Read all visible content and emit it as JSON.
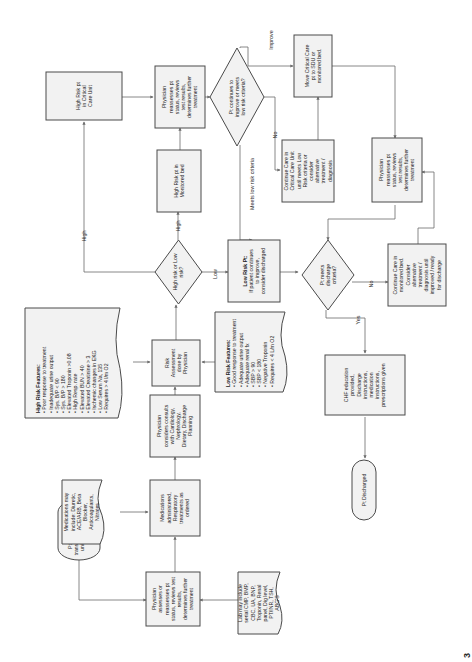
{
  "diagram": {
    "orientation": "rotated-90-counterclockwise",
    "nodes": {
      "start": {
        "type": "terminator",
        "lines": [
          "Pt with acute HF",
          "transported to nursing",
          "unit from ED or as",
          "Direct Admit"
        ]
      },
      "assess": {
        "type": "process",
        "lines": [
          "Physician",
          "assesses or",
          "reassesses pt",
          "status, reviews test",
          "results,",
          "determines further",
          "treatment"
        ]
      },
      "labs": {
        "type": "document",
        "lines": [
          "Lab may include",
          "serial CMP, BMP,",
          "CBC, UA, BNP,",
          "Troponin, Renal",
          "panel, Dig level,",
          "PT/INR, TSH,",
          "ABG'S"
        ]
      },
      "meds_admin": {
        "type": "process",
        "lines": [
          "Medications",
          "administered,",
          "Respiratory",
          "treatments as",
          "ordered"
        ]
      },
      "meds_note": {
        "type": "document",
        "lines": [
          "Medications may",
          "include: Diuretic,",
          "ACE/ARB, Beta",
          "Blocker,",
          "Anticoagulants,",
          "Nitrates"
        ]
      },
      "consults": {
        "type": "process",
        "lines": [
          "Physician",
          "considers consults",
          "with Cardiology,",
          "Nephrology,",
          "Dietary, Discharge",
          "Planning"
        ]
      },
      "risk_assess": {
        "type": "process",
        "lines": [
          "Risk",
          "Assessment",
          "done by",
          "Physician"
        ]
      },
      "high_features": {
        "type": "document",
        "title": "High Risk Features:",
        "items": [
          "Poor response to treatment",
          "Inadequate urine output",
          "Sys. B/P < 90",
          "Sys. B/P > 180",
          "Elevated Troponin >0.08",
          "High Resp. rate",
          "Elevated BUN > 40",
          "Elevated Creatinine > 3",
          "Ischemic changes in EKG",
          "Low Serum Na, 135",
          "Requires > 4 l/m O2"
        ]
      },
      "low_features": {
        "type": "document",
        "title": "Low Risk Features:",
        "items": [
          "Good response to treatment",
          "Adequate urine output",
          "Adequate renal fx",
          "SBP > 90",
          "SBP < 180",
          "Negative Troponin",
          "Requires < 4 L/m O2"
        ]
      },
      "risk_decision": {
        "type": "decision",
        "lines": [
          "High risk or Low",
          "risk?"
        ]
      },
      "low_risk_pt": {
        "type": "process",
        "title": "Low Risk Pt:",
        "lines": [
          "If patient continues",
          "to improve,",
          "consider discharged"
        ]
      },
      "high_monitored": {
        "type": "process",
        "lines": [
          "High Risk pt in",
          "Monitored bed"
        ]
      },
      "high_ccu": {
        "type": "process",
        "lines": [
          "High Risk pt",
          "in Critical",
          "Care Unit"
        ]
      },
      "reassess_top": {
        "type": "process",
        "lines": [
          "Physician",
          "reassesses pt",
          "status, reviews",
          "test results,",
          "determines further",
          "treatment"
        ]
      },
      "improve_decision": {
        "type": "decision",
        "lines": [
          "Pt continues to",
          "improve or meets",
          "low risk criteria?"
        ]
      },
      "move_ccu": {
        "type": "process",
        "lines": [
          "Move Critical Care",
          "pt to SDU or",
          "monitored bed."
        ]
      },
      "continue_ccu": {
        "type": "process",
        "lines": [
          "Continue Care in",
          "Critical Care Unit",
          "until meets Low",
          "Risk criteria or",
          "consider",
          "alternative",
          "treatment /",
          "diagnosis"
        ]
      },
      "reassess_right": {
        "type": "process",
        "lines": [
          "Physician",
          "reassesses pt",
          "status, reviews",
          "test results,",
          "determines further",
          "treatment"
        ]
      },
      "discharge_decision": {
        "type": "decision",
        "lines": [
          "Pt meets",
          "discharge",
          "criteria?"
        ]
      },
      "continue_monitored": {
        "type": "process",
        "lines": [
          "Continue Care in",
          "monitored bed.",
          "Consider",
          "alternative",
          "treatment /",
          "diagnosis until",
          "improved / ready",
          "for discharge"
        ]
      },
      "chf_education": {
        "type": "process",
        "lines": [
          "CHF education",
          "provided,",
          "Discharge",
          "instructions,",
          "medication",
          "instructions,",
          "prescriptions given"
        ]
      },
      "discharged": {
        "type": "terminator",
        "lines": [
          "Pt Discharged"
        ]
      }
    },
    "edge_labels": {
      "high_to_ccu": "High",
      "high_to_monitored": "High",
      "low": "Low",
      "improve": "Improve",
      "no_ccu": "No",
      "meets_low": "Meets low risk criteria",
      "no_discharge": "No",
      "yes_discharge": "Yes"
    },
    "page_number": "3"
  }
}
